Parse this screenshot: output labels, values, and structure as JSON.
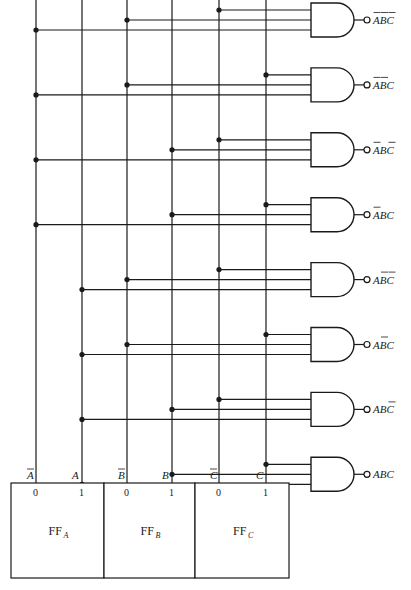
{
  "diagram": {
    "type": "3-to-8 decoder (AND-gate matrix driven by flip-flops)",
    "flip_flops": [
      {
        "name": "FF",
        "subscript": "A",
        "outputs": [
          {
            "pin": "0",
            "signal": "A",
            "complemented": true
          },
          {
            "pin": "1",
            "signal": "A",
            "complemented": false
          }
        ]
      },
      {
        "name": "FF",
        "subscript": "B",
        "outputs": [
          {
            "pin": "0",
            "signal": "B",
            "complemented": true
          },
          {
            "pin": "1",
            "signal": "B",
            "complemented": false
          }
        ]
      },
      {
        "name": "FF",
        "subscript": "C",
        "outputs": [
          {
            "pin": "0",
            "signal": "C",
            "complemented": true
          },
          {
            "pin": "1",
            "signal": "C",
            "complemented": false
          }
        ]
      }
    ],
    "bus_lines": [
      {
        "id": "A_bar",
        "label": "A",
        "bar": true,
        "x": 36
      },
      {
        "id": "A",
        "label": "A",
        "bar": false,
        "x": 82
      },
      {
        "id": "B_bar",
        "label": "B",
        "bar": true,
        "x": 127
      },
      {
        "id": "B",
        "label": "B",
        "bar": false,
        "x": 172
      },
      {
        "id": "C_bar",
        "label": "C",
        "bar": true,
        "x": 219
      },
      {
        "id": "C",
        "label": "C",
        "bar": false,
        "x": 266
      }
    ],
    "gates": [
      {
        "output": [
          {
            "l": "A",
            "bar": true
          },
          {
            "l": "B",
            "bar": true
          },
          {
            "l": "C",
            "bar": true
          }
        ],
        "inputs": [
          "C_bar",
          "B_bar",
          "A_bar"
        ]
      },
      {
        "output": [
          {
            "l": "A",
            "bar": true
          },
          {
            "l": "B",
            "bar": true
          },
          {
            "l": "C",
            "bar": false
          }
        ],
        "inputs": [
          "C",
          "B_bar",
          "A_bar"
        ]
      },
      {
        "output": [
          {
            "l": "A",
            "bar": true
          },
          {
            "l": "B",
            "bar": false
          },
          {
            "l": "C",
            "bar": true
          }
        ],
        "inputs": [
          "C_bar",
          "B",
          "A_bar"
        ]
      },
      {
        "output": [
          {
            "l": "A",
            "bar": true
          },
          {
            "l": "B",
            "bar": false
          },
          {
            "l": "C",
            "bar": false
          }
        ],
        "inputs": [
          "C",
          "B",
          "A_bar"
        ]
      },
      {
        "output": [
          {
            "l": "A",
            "bar": false
          },
          {
            "l": "B",
            "bar": true
          },
          {
            "l": "C",
            "bar": true
          }
        ],
        "inputs": [
          "C_bar",
          "B_bar",
          "A"
        ]
      },
      {
        "output": [
          {
            "l": "A",
            "bar": false
          },
          {
            "l": "B",
            "bar": true
          },
          {
            "l": "C",
            "bar": false
          }
        ],
        "inputs": [
          "C",
          "B_bar",
          "A"
        ]
      },
      {
        "output": [
          {
            "l": "A",
            "bar": false
          },
          {
            "l": "B",
            "bar": false
          },
          {
            "l": "C",
            "bar": true
          }
        ],
        "inputs": [
          "C_bar",
          "B",
          "A"
        ]
      },
      {
        "output": [
          {
            "l": "A",
            "bar": false
          },
          {
            "l": "B",
            "bar": false
          },
          {
            "l": "C",
            "bar": false
          }
        ],
        "inputs": [
          "C",
          "B",
          "A"
        ]
      }
    ],
    "gate_output_labels": [
      "ĀB̄C̄",
      "ĀB̄C",
      "ĀBC̄",
      "ĀBC",
      "AB̄C̄",
      "AB̄C",
      "ABC̄",
      "ABC"
    ],
    "pin_labels": [
      "0",
      "1"
    ],
    "ff_labels": [
      "FFA",
      "FFB",
      "FFC"
    ]
  }
}
